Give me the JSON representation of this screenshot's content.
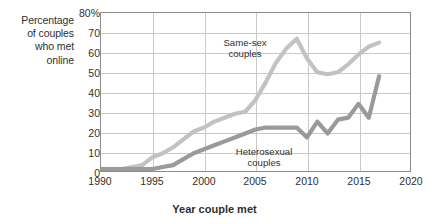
{
  "axis": {
    "y_caption_lines": [
      "Percentage",
      "of couples",
      "who met",
      "online"
    ],
    "y_ticks": [
      "80%",
      "70",
      "60",
      "50",
      "40",
      "30",
      "20",
      "10",
      "0"
    ],
    "x_ticks": [
      "1990",
      "1995",
      "2000",
      "2005",
      "2010",
      "2015",
      "2020"
    ],
    "x_title": "Year couple met"
  },
  "annotations": {
    "same_sex": {
      "line1": "Same-sex",
      "line2": "couples"
    },
    "heterosexual": {
      "line1": "Heterosexual",
      "line2": "couples"
    }
  },
  "colors": {
    "same_sex_line": "#c2c2c2",
    "heterosexual_line": "#9a9a9a",
    "grid": "#c9c9c9",
    "frame": "#8d8d8d",
    "text": "#2f2f2f"
  },
  "chart_data": {
    "type": "line",
    "title": "",
    "xlabel": "Year couple met",
    "ylabel": "Percentage of couples who met online",
    "xlim": [
      1990,
      2020
    ],
    "ylim": [
      0,
      80
    ],
    "ytick_step": 10,
    "xtick_step": 5,
    "grid": true,
    "legend": "inline annotations",
    "series": [
      {
        "name": "Same-sex couples",
        "color": "#c2c2c2",
        "x": [
          1990,
          1991,
          1992,
          1993,
          1994,
          1995,
          1996,
          1997,
          1998,
          1999,
          2000,
          2001,
          2002,
          2003,
          2004,
          2005,
          2006,
          2007,
          2008,
          2009,
          2010,
          2011,
          2012,
          2013,
          2014,
          2015,
          2016,
          2017
        ],
        "y": [
          1,
          1,
          1,
          2,
          3,
          7,
          9,
          12,
          16,
          20,
          22,
          25,
          27,
          29,
          30,
          36,
          45,
          55,
          62,
          67,
          57,
          50,
          49,
          50,
          54,
          59,
          63,
          65
        ]
      },
      {
        "name": "Heterosexual couples",
        "color": "#9a9a9a",
        "x": [
          1990,
          1991,
          1992,
          1993,
          1994,
          1995,
          1996,
          1997,
          1998,
          1999,
          2000,
          2001,
          2002,
          2003,
          2004,
          2005,
          2006,
          2007,
          2008,
          2009,
          2010,
          2011,
          2012,
          2013,
          2014,
          2015,
          2016,
          2017
        ],
        "y": [
          1,
          1,
          1,
          1,
          1,
          1,
          2,
          3,
          6,
          9,
          11,
          13,
          15,
          17,
          19,
          21,
          22,
          22,
          22,
          22,
          17,
          25,
          19,
          26,
          27,
          34,
          27,
          48
        ]
      }
    ]
  }
}
